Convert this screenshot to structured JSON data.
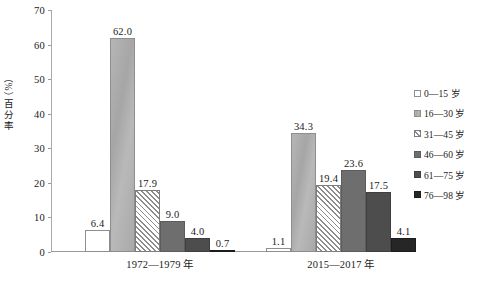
{
  "chart_data": {
    "type": "bar",
    "title": "",
    "subtitle": "",
    "xlabel": "",
    "ylabel": "百分率（%）",
    "ylim": [
      0,
      70
    ],
    "yticks": [
      0,
      10,
      20,
      30,
      40,
      50,
      60,
      70
    ],
    "grid": false,
    "legend_position": "right",
    "categories": [
      "1972—1979 年",
      "2015—2017 年"
    ],
    "series": [
      {
        "name": "0—15 岁",
        "values": [
          6.4,
          1.1
        ],
        "labels": [
          "6.4",
          "1.1"
        ],
        "color": "#ffffff",
        "pattern": "solid"
      },
      {
        "name": "16—30 岁",
        "values": [
          62.0,
          34.3
        ],
        "labels": [
          "62.0",
          "34.3"
        ],
        "color": "#aeaeae",
        "pattern": "solid"
      },
      {
        "name": "31—45 岁",
        "values": [
          17.9,
          19.4
        ],
        "labels": [
          "17.9",
          "19.4"
        ],
        "color": "#8c8c8c",
        "pattern": "diagonal-hatch"
      },
      {
        "name": "46—60 岁",
        "values": [
          9.0,
          23.6
        ],
        "labels": [
          "9.0",
          "23.6"
        ],
        "color": "#6e6e6e",
        "pattern": "solid"
      },
      {
        "name": "61—75 岁",
        "values": [
          4.0,
          17.5
        ],
        "labels": [
          "4.0",
          "17.5"
        ],
        "color": "#4d4d4d",
        "pattern": "solid"
      },
      {
        "name": "76—98 岁",
        "values": [
          0.7,
          4.1
        ],
        "labels": [
          "0.7",
          "4.1"
        ],
        "color": "#262626",
        "pattern": "solid"
      }
    ]
  },
  "axis": {
    "y_title": "百分率（%）",
    "y_title_chars": [
      "百",
      "分",
      "率"
    ],
    "y_title_unit": "（%）",
    "tick_labels": [
      "70",
      "60",
      "50",
      "40",
      "30",
      "20",
      "10",
      "0"
    ]
  },
  "legend": {
    "items": [
      {
        "label": "0—15 岁"
      },
      {
        "label": "16—30 岁"
      },
      {
        "label": "31—45 岁"
      },
      {
        "label": "46—60 岁"
      },
      {
        "label": "61—75 岁"
      },
      {
        "label": "76—98 岁"
      }
    ]
  },
  "x_labels": [
    {
      "text": "1972—1979 年"
    },
    {
      "text": "2015—2017 年"
    }
  ]
}
